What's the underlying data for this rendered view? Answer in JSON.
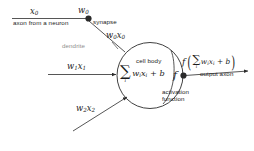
{
  "diagram": {
    "colors": {
      "stroke": "#2b2b2b",
      "text": "#1b1b1b",
      "muted": "#8e8e8e",
      "background": "#ffffff"
    },
    "labels": {
      "x0": "x",
      "x0_sub": "0",
      "w0": "w",
      "w0_sub": "0",
      "axon_from_neuron": "axon from a neuron",
      "synapse": "synapse",
      "dendrite": "dendrite",
      "w0x0": "w",
      "w0x0_sub1": "0",
      "w0x0_b": "x",
      "w0x0_sub2": "0",
      "w1x1_w": "w",
      "w1x1_wsub": "1",
      "w1x1_x": "x",
      "w1x1_xsub": "1",
      "w2x2_w": "w",
      "w2x2_wsub": "2",
      "w2x2_x": "x",
      "w2x2_xsub": "2",
      "cell_body": "cell body",
      "activation_function": "activation\nfunction",
      "output_axon": "output axon",
      "f_glyph": "f"
    },
    "soma_expression": {
      "sigma": "∑",
      "sigma_index": "i",
      "body_w": "w",
      "body_wsub": "i",
      "body_x": "x",
      "body_xsub": "i",
      "body_plus_b": " + b"
    },
    "output_expression": {
      "fn": "f",
      "open_paren": "(",
      "sigma": "∑",
      "sigma_index": "i",
      "body_w": "w",
      "body_wsub": "i",
      "body_x": "x",
      "body_xsub": "i",
      "body_plus_b": " + b",
      "close_paren": ")"
    }
  }
}
